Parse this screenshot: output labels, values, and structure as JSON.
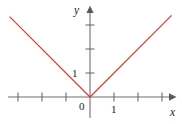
{
  "figure": {
    "background_color": "#ffffff",
    "width": 182,
    "height": 124
  },
  "chart_data": {
    "type": "line",
    "title": "",
    "subtitle": "",
    "xlabel": "x",
    "ylabel": "y",
    "function_label": "y = |x|",
    "grid": false,
    "legend": null,
    "legend_position": "none",
    "annotations": [],
    "axes": {
      "origin_label": "0",
      "x_axis": {
        "label": "x",
        "tick_labels": [
          "1"
        ],
        "labeled_tick_values": [
          1
        ],
        "tick_values": [
          -3,
          -2,
          -1,
          1,
          2,
          3
        ],
        "range": [
          -3.4,
          3.4
        ],
        "arrow": "right"
      },
      "y_axis": {
        "label": "y",
        "tick_labels": [
          "1"
        ],
        "labeled_tick_values": [
          1
        ],
        "tick_values": [
          1,
          2,
          3
        ],
        "range": [
          -1.0,
          3.7
        ],
        "arrow": "up"
      }
    },
    "series": [
      {
        "name": "y = |x|",
        "color": "#e03a34",
        "style": "solid",
        "x": [
          -3.35,
          0,
          3.4
        ],
        "values": [
          3.35,
          0,
          3.4
        ]
      }
    ]
  },
  "labels": {
    "y_axis_name": "y",
    "x_axis_name": "x",
    "origin": "0",
    "y_unit": "1",
    "x_unit": "1"
  },
  "colors": {
    "curve": "#e03a34",
    "axis": "#6e6e6e",
    "arrow": "#5a5a5a",
    "text": "#1c1c1c",
    "background": "#ffffff"
  }
}
